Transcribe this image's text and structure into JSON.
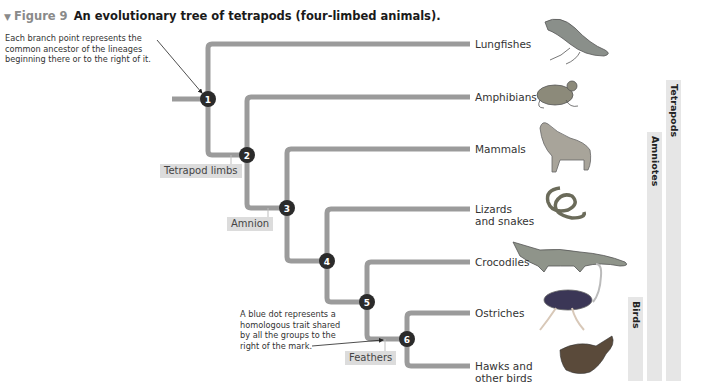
{
  "figure": {
    "triangle_icon": "▼",
    "number": "Figure 9",
    "title": "An evolutionary tree of tetrapods (four-limbed animals)."
  },
  "annotations": {
    "branch_point_note": "Each branch point represents the common ancestor of the lineages beginning there or to the right of it.",
    "blue_dot_note": "A blue dot represents a homologous trait shared by all the groups to the right of the mark."
  },
  "nodes": [
    "1",
    "2",
    "3",
    "4",
    "5",
    "6"
  ],
  "traits": [
    "Tetrapod limbs",
    "Amnion",
    "Feathers"
  ],
  "taxa": [
    {
      "name": "Lungfishes",
      "icon": "lungfish-illustration"
    },
    {
      "name": "Amphibians",
      "icon": "frog-illustration"
    },
    {
      "name": "Mammals",
      "icon": "wolf-illustration"
    },
    {
      "name": "Lizards\nand snakes",
      "icon": "snake-illustration"
    },
    {
      "name": "Crocodiles",
      "icon": "crocodile-illustration"
    },
    {
      "name": "Ostriches",
      "icon": "ostrich-illustration"
    },
    {
      "name": "Hawks and\nother birds",
      "icon": "hawk-illustration"
    }
  ],
  "clades": [
    "Tetrapods",
    "Amniotes",
    "Birds"
  ],
  "colors": {
    "branch": "#9b9b9b",
    "node_fill": "#2b2b2b",
    "node_text": "#ffffff",
    "trait_bg": "#dcdcdc",
    "clade_bar": "#e6e6e6"
  }
}
